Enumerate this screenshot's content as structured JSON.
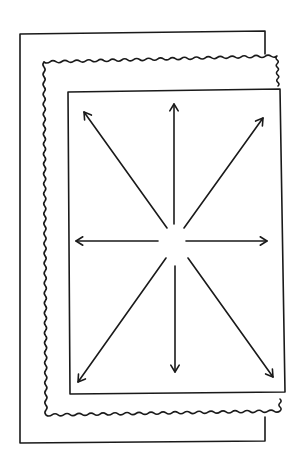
{
  "diagram": {
    "colors": {
      "ink": "#1a1a1a",
      "background": "#ffffff"
    },
    "layers": [
      {
        "name": "outer-frame",
        "style": "solid",
        "left": 20,
        "top": 34,
        "right": 265,
        "bottom": 443,
        "right_edge_segments": [
          [
            31,
            54
          ],
          [
            417,
            440
          ]
        ]
      },
      {
        "name": "wavy-sheet",
        "style": "wavy",
        "left": 44,
        "top": 58,
        "right": 277,
        "bottom": 415
      },
      {
        "name": "inner-sheet",
        "style": "solid",
        "left": 68,
        "top": 90,
        "right": 280,
        "bottom": 392
      }
    ],
    "center": {
      "x": 175,
      "y": 241
    },
    "arrows": [
      {
        "direction": "up",
        "x1": 174,
        "y1": 224,
        "x2": 174,
        "y2": 104
      },
      {
        "direction": "down",
        "x1": 175,
        "y1": 266,
        "x2": 175,
        "y2": 372
      },
      {
        "direction": "left",
        "x1": 158,
        "y1": 241,
        "x2": 76,
        "y2": 241
      },
      {
        "direction": "right",
        "x1": 186,
        "y1": 241,
        "x2": 267,
        "y2": 241
      },
      {
        "direction": "up-left",
        "x1": 167,
        "y1": 228,
        "x2": 84,
        "y2": 112
      },
      {
        "direction": "up-right",
        "x1": 184,
        "y1": 228,
        "x2": 263,
        "y2": 118
      },
      {
        "direction": "down-left",
        "x1": 166,
        "y1": 258,
        "x2": 78,
        "y2": 382
      },
      {
        "direction": "down-right",
        "x1": 188,
        "y1": 258,
        "x2": 273,
        "y2": 377
      }
    ]
  }
}
